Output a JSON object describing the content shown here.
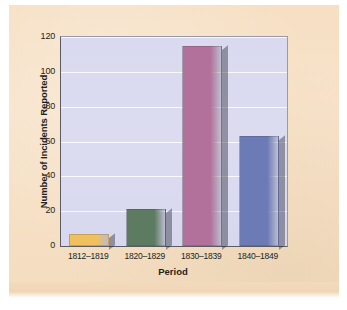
{
  "chart_data": {
    "type": "bar",
    "title": "",
    "subtitle": "",
    "xlabel": "Period",
    "ylabel": "Number of Incidents Reported",
    "categories": [
      "1812–1819",
      "1820–1829",
      "1830–1839",
      "1840–1849"
    ],
    "values": [
      7,
      21,
      115,
      63
    ],
    "series": [
      {
        "name": "Number of Incidents Reported",
        "values": [
          7,
          21,
          115,
          63
        ]
      }
    ],
    "ylim": [
      0,
      120
    ],
    "yticks": [
      0,
      20,
      40,
      60,
      80,
      100,
      120
    ],
    "ytick_labels": [
      "0",
      "20",
      "40",
      "60",
      "80",
      "100",
      "120"
    ],
    "grid": true,
    "grid_axis": "y",
    "legend": false,
    "legend_position": "none",
    "bar_colors": [
      "#f0bf5e",
      "#5d7b60",
      "#b1719a",
      "#6c7ab5"
    ],
    "annotations": []
  },
  "style": {
    "page_background": "#f6e1c7",
    "plot_background": "#dadaf0",
    "gridline_color": "#ffffff",
    "axis_color": "#5b5b63",
    "text_color": "#231f20"
  }
}
